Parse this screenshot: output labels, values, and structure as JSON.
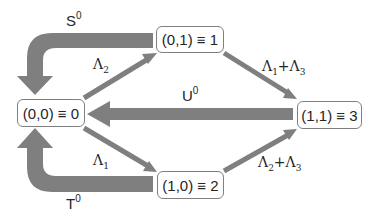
{
  "diagram": {
    "type": "state-transition",
    "colors": {
      "arrow": "#7f7f7f",
      "box_border": "#7f7f7f",
      "text": "#262626",
      "background": "#ffffff"
    },
    "states": [
      {
        "id": "s0",
        "label": "(0,0) ≡ 0"
      },
      {
        "id": "s1",
        "label": "(0,1) ≡ 1"
      },
      {
        "id": "s2",
        "label": "(1,0) ≡ 2"
      },
      {
        "id": "s3",
        "label": "(1,1) ≡ 3"
      }
    ],
    "transitions": [
      {
        "from": "s0",
        "to": "s1",
        "rate": "Λ₂",
        "style": "thin"
      },
      {
        "from": "s0",
        "to": "s2",
        "rate": "Λ₁",
        "style": "thin"
      },
      {
        "from": "s1",
        "to": "s3",
        "rate": "Λ₁+Λ₃",
        "style": "thin"
      },
      {
        "from": "s2",
        "to": "s3",
        "rate": "Λ₂+Λ₃",
        "style": "thin"
      },
      {
        "from": "s1",
        "to": "s0",
        "rate": "S⁰",
        "style": "thick-curved"
      },
      {
        "from": "s3",
        "to": "s0",
        "rate": "U⁰",
        "style": "thick"
      },
      {
        "from": "s2",
        "to": "s0",
        "rate": "T⁰",
        "style": "thick-curved"
      }
    ],
    "labels": {
      "s_base": "S",
      "s_sup": "0",
      "u_base": "U",
      "u_sup": "0",
      "t_base": "T",
      "t_sup": "0",
      "l2_base": "Λ",
      "l2_sub": "2",
      "l1_base": "Λ",
      "l1_sub": "1",
      "l13_a": "Λ",
      "l13_a_sub": "1",
      "l13_plus": "+",
      "l13_b": "Λ",
      "l13_b_sub": "3",
      "l23_a": "Λ",
      "l23_a_sub": "2",
      "l23_plus": "+",
      "l23_b": "Λ",
      "l23_b_sub": "3"
    }
  }
}
